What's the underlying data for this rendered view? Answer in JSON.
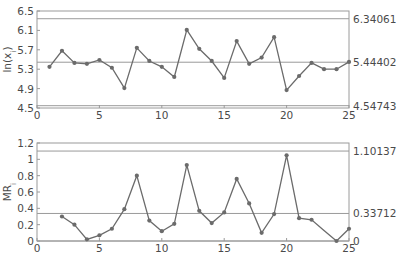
{
  "chart_data": [
    {
      "type": "line",
      "title": "",
      "xlabel": "",
      "ylabel": "ln(x_i)",
      "ylabel_main": "ln(x",
      "ylabel_sub": "i",
      "ylabel_close": ")",
      "xlim": [
        0,
        25
      ],
      "ylim": [
        4.5,
        6.5
      ],
      "xticks": [
        0,
        5,
        10,
        15,
        20,
        25
      ],
      "yticks": [
        4.5,
        4.9,
        5.3,
        5.7,
        6.1,
        6.5
      ],
      "ytick_labels": [
        "4.5",
        "4.9",
        "5.3",
        "5.7",
        "6.1",
        "6.5"
      ],
      "grid": false,
      "control_limits": {
        "ucl": 6.34061,
        "cl": 5.44402,
        "lcl": 4.54743,
        "ucl_label": "6.34061",
        "cl_label": "5.44402",
        "lcl_label": "4.54743"
      },
      "series": [
        {
          "name": "ln(x_i)",
          "x": [
            1,
            2,
            3,
            4,
            5,
            6,
            7,
            8,
            9,
            10,
            11,
            12,
            13,
            14,
            15,
            16,
            17,
            18,
            19,
            20,
            21,
            22,
            23,
            24,
            25
          ],
          "values": [
            5.35,
            5.68,
            5.43,
            5.41,
            5.49,
            5.33,
            4.91,
            5.74,
            5.47,
            5.35,
            5.14,
            6.11,
            5.72,
            5.47,
            5.12,
            5.88,
            5.41,
            5.54,
            5.96,
            4.87,
            5.16,
            5.43,
            5.3,
            5.3,
            5.45
          ]
        }
      ]
    },
    {
      "type": "line",
      "title": "",
      "xlabel": "",
      "ylabel": "MR_i",
      "ylabel_main": "MR",
      "ylabel_sub": "i",
      "ylabel_close": "",
      "xlim": [
        0,
        25
      ],
      "ylim": [
        0,
        1.2
      ],
      "xticks": [
        0,
        5,
        10,
        15,
        20,
        25
      ],
      "yticks": [
        0,
        0.2,
        0.4,
        0.6,
        0.8,
        1,
        1.2
      ],
      "ytick_labels": [
        "0",
        "0.2",
        "0.4",
        "0.6",
        "0.8",
        "1",
        "1.2"
      ],
      "grid": false,
      "control_limits": {
        "ucl": 1.10137,
        "cl": 0.33712,
        "lcl": 0,
        "ucl_label": "1.10137",
        "cl_label": "0.33712",
        "lcl_label": "0"
      },
      "series": [
        {
          "name": "MR_i",
          "x": [
            2,
            3,
            4,
            5,
            6,
            7,
            8,
            9,
            10,
            11,
            12,
            13,
            14,
            15,
            16,
            17,
            18,
            19,
            20,
            21,
            22,
            23,
            24,
            25
          ],
          "values": [
            0.3,
            0.2,
            0.02,
            0.07,
            0.15,
            0.39,
            0.8,
            0.25,
            0.12,
            0.21,
            0.93,
            0.37,
            0.22,
            0.35,
            0.76,
            0.46,
            0.1,
            0.33,
            1.05,
            0.28,
            0.26,
            0.13,
            0.0,
            0.15
          ],
          "markers_hidden_at": [
            23
          ]
        }
      ]
    }
  ],
  "colors": {
    "line": "#6b6b6b",
    "marker": "#6b6b6b",
    "frame": "#9a9a9a",
    "control_line": "#9a9a9a",
    "text": "#4a4a4a"
  }
}
